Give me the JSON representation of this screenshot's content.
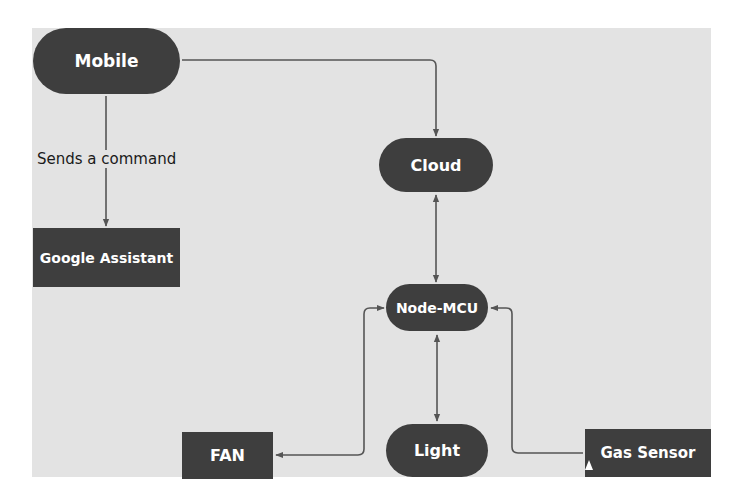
{
  "diagram": {
    "colors": {
      "background": "#e3e3e3",
      "node_fill": "#3e3e3e",
      "node_text": "#ffffff",
      "connector": "#555555",
      "label_text": "#1a1a1a"
    },
    "nodes": {
      "mobile": {
        "label": "Mobile",
        "shape": "pill"
      },
      "google_assistant": {
        "label": "Google Assistant",
        "shape": "rect"
      },
      "cloud": {
        "label": "Cloud",
        "shape": "pill"
      },
      "node_mcu": {
        "label": "Node-MCU",
        "shape": "pill"
      },
      "fan": {
        "label": "FAN",
        "shape": "rect"
      },
      "light": {
        "label": "Light",
        "shape": "pill"
      },
      "gas_sensor": {
        "label": "Gas Sensor",
        "shape": "rect"
      }
    },
    "edges": [
      {
        "from": "Mobile",
        "to": "Google Assistant",
        "label": "Sends a command",
        "direction": "one-way"
      },
      {
        "from": "Mobile",
        "to": "Cloud",
        "label": "",
        "direction": "one-way"
      },
      {
        "from": "Cloud",
        "to": "Node-MCU",
        "label": "",
        "direction": "two-way"
      },
      {
        "from": "Node-MCU",
        "to": "FAN",
        "label": "",
        "direction": "two-way"
      },
      {
        "from": "Node-MCU",
        "to": "Light",
        "label": "",
        "direction": "two-way"
      },
      {
        "from": "Gas Sensor",
        "to": "Node-MCU",
        "label": "",
        "direction": "one-way"
      }
    ],
    "edge_labels": {
      "mobile_to_assistant": "Sends a command"
    }
  }
}
